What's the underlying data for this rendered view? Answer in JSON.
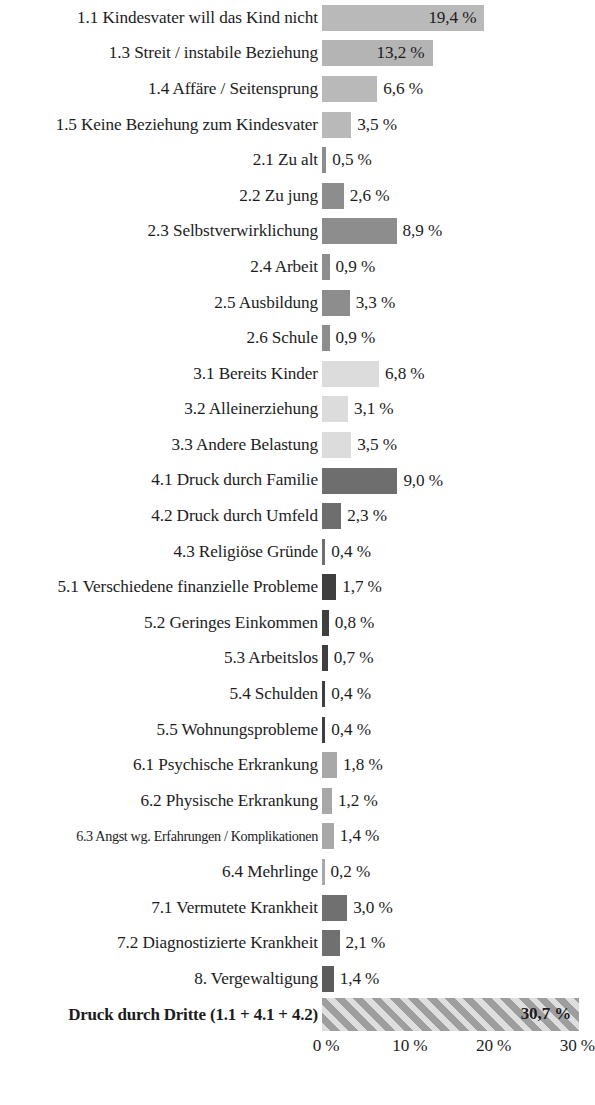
{
  "chart_data": {
    "type": "bar",
    "orientation": "horizontal",
    "title": "",
    "subtitle": "",
    "xlabel": "",
    "ylabel": "",
    "xlim": [
      0,
      32
    ],
    "grid": false,
    "legend": null,
    "value_suffix": " %",
    "decimal_separator": ",",
    "axis_ticks": [
      {
        "label": "0 %",
        "value": 0
      },
      {
        "label": "10 %",
        "value": 10
      },
      {
        "label": "20 %",
        "value": 20
      },
      {
        "label": "30 %",
        "value": 30
      }
    ],
    "categories": [
      "1.1 Kindesvater will das Kind nicht",
      "1.3 Streit / instabile Beziehung",
      "1.4 Affäre / Seitensprung",
      "1.5 Keine Beziehung zum Kindesvater",
      "2.1 Zu alt",
      "2.2 Zu jung",
      "2.3 Selbstverwirklichung",
      "2.4 Arbeit",
      "2.5 Ausbildung",
      "2.6 Schule",
      "3.1 Bereits Kinder",
      "3.2 Alleinerziehung",
      "3.3 Andere Belastung",
      "4.1 Druck durch Familie",
      "4.2 Druck durch Umfeld",
      "4.3 Religiöse Gründe",
      "5.1 Verschiedene finanzielle Probleme",
      "5.2 Geringes Einkommen",
      "5.3 Arbeitslos",
      "5.4 Schulden",
      "5.5 Wohnungsprobleme",
      "6.1 Psychische Erkrankung",
      "6.2 Physische Erkrankung",
      "6.3 Angst wg. Erfahrungen / Komplikationen",
      "6.4 Mehrlinge",
      "7.1 Vermutete Krankheit",
      "7.2 Diagnostizierte Krankheit",
      "8. Vergewaltigung",
      "Druck durch Dritte (1.1 + 4.1 + 4.2)"
    ],
    "values": [
      19.4,
      13.2,
      6.6,
      3.5,
      0.5,
      2.6,
      8.9,
      0.9,
      3.3,
      0.9,
      6.8,
      3.1,
      3.5,
      9.0,
      2.3,
      0.4,
      1.7,
      0.8,
      0.7,
      0.4,
      0.4,
      1.8,
      1.2,
      1.4,
      0.2,
      3.0,
      2.1,
      1.4,
      30.7
    ],
    "value_labels": [
      "19,4 %",
      "13,2 %",
      "6,6 %",
      "3,5 %",
      "0,5 %",
      "2,6 %",
      "8,9 %",
      "0,9 %",
      "3,3 %",
      "0,9 %",
      "6,8 %",
      "3,1 %",
      "3,5 %",
      "9,0 %",
      "2,3 %",
      "0,4 %",
      "1,7 %",
      "0,8 %",
      "0,7 %",
      "0,4 %",
      "0,4 %",
      "1,8 %",
      "1,2 %",
      "1,4 %",
      "0,2 %",
      "3,0 %",
      "2,1 %",
      "1,4 %",
      "30,7 %"
    ],
    "bar_colors": [
      "#b9b9b9",
      "#b4b4b4",
      "#b9b9b9",
      "#b9b9b9",
      "#8d8d8d",
      "#8d8d8d",
      "#8d8d8d",
      "#8d8d8d",
      "#8d8d8d",
      "#8d8d8d",
      "#dcdcdc",
      "#dcdcdc",
      "#dcdcdc",
      "#6e6e6e",
      "#6e6e6e",
      "#6e6e6e",
      "#3f3f3f",
      "#3f3f3f",
      "#3f3f3f",
      "#3f3f3f",
      "#3f3f3f",
      "#a8a8a8",
      "#a8a8a8",
      "#a8a8a8",
      "#a8a8a8",
      "#707070",
      "#707070",
      "#5c5c5c",
      "striped"
    ],
    "bars": [
      {
        "label": "1.1 Kindesvater will das Kind nicht",
        "value": 19.4,
        "value_label": "19,4 %",
        "color": "#b9b9b9",
        "label_inside": true
      },
      {
        "label": "1.3 Streit / instabile Beziehung",
        "value": 13.2,
        "value_label": "13,2 %",
        "color": "#b4b4b4",
        "label_inside": true
      },
      {
        "label": "1.4 Affäre / Seitensprung",
        "value": 6.6,
        "value_label": "6,6 %",
        "color": "#b9b9b9",
        "label_inside": false
      },
      {
        "label": "1.5 Keine Beziehung zum Kindesvater",
        "value": 3.5,
        "value_label": "3,5 %",
        "color": "#b9b9b9",
        "label_inside": false
      },
      {
        "label": "2.1 Zu alt",
        "value": 0.5,
        "value_label": "0,5 %",
        "color": "#8d8d8d",
        "label_inside": false
      },
      {
        "label": "2.2 Zu jung",
        "value": 2.6,
        "value_label": "2,6 %",
        "color": "#8d8d8d",
        "label_inside": false
      },
      {
        "label": "2.3 Selbstverwirklichung",
        "value": 8.9,
        "value_label": "8,9 %",
        "color": "#8d8d8d",
        "label_inside": false
      },
      {
        "label": "2.4 Arbeit",
        "value": 0.9,
        "value_label": "0,9 %",
        "color": "#8d8d8d",
        "label_inside": false
      },
      {
        "label": "2.5 Ausbildung",
        "value": 3.3,
        "value_label": "3,3 %",
        "color": "#8d8d8d",
        "label_inside": false
      },
      {
        "label": "2.6 Schule",
        "value": 0.9,
        "value_label": "0,9 %",
        "color": "#8d8d8d",
        "label_inside": false
      },
      {
        "label": "3.1 Bereits Kinder",
        "value": 6.8,
        "value_label": "6,8 %",
        "color": "#dcdcdc",
        "label_inside": false
      },
      {
        "label": "3.2 Alleinerziehung",
        "value": 3.1,
        "value_label": "3,1 %",
        "color": "#dcdcdc",
        "label_inside": false
      },
      {
        "label": "3.3 Andere Belastung",
        "value": 3.5,
        "value_label": "3,5 %",
        "color": "#dcdcdc",
        "label_inside": false
      },
      {
        "label": "4.1 Druck durch Familie",
        "value": 9.0,
        "value_label": "9,0 %",
        "color": "#6e6e6e",
        "label_inside": false
      },
      {
        "label": "4.2 Druck durch Umfeld",
        "value": 2.3,
        "value_label": "2,3 %",
        "color": "#6e6e6e",
        "label_inside": false
      },
      {
        "label": "4.3 Religiöse Gründe",
        "value": 0.4,
        "value_label": "0,4 %",
        "color": "#6e6e6e",
        "label_inside": false
      },
      {
        "label": "5.1 Verschiedene finanzielle Probleme",
        "value": 1.7,
        "value_label": "1,7 %",
        "color": "#3f3f3f",
        "label_inside": false
      },
      {
        "label": "5.2 Geringes Einkommen",
        "value": 0.8,
        "value_label": "0,8 %",
        "color": "#3f3f3f",
        "label_inside": false
      },
      {
        "label": "5.3 Arbeitslos",
        "value": 0.7,
        "value_label": "0,7 %",
        "color": "#3f3f3f",
        "label_inside": false
      },
      {
        "label": "5.4 Schulden",
        "value": 0.4,
        "value_label": "0,4 %",
        "color": "#3f3f3f",
        "label_inside": false
      },
      {
        "label": "5.5 Wohnungsprobleme",
        "value": 0.4,
        "value_label": "0,4 %",
        "color": "#3f3f3f",
        "label_inside": false
      },
      {
        "label": "6.1 Psychische Erkrankung",
        "value": 1.8,
        "value_label": "1,8 %",
        "color": "#a8a8a8",
        "label_inside": false
      },
      {
        "label": "6.2 Physische Erkrankung",
        "value": 1.2,
        "value_label": "1,2 %",
        "color": "#a8a8a8",
        "label_inside": false
      },
      {
        "label": "6.3 Angst wg. Erfahrungen / Komplikationen",
        "value": 1.4,
        "value_label": "1,4 %",
        "color": "#a8a8a8",
        "label_inside": false
      },
      {
        "label": "6.4 Mehrlinge",
        "value": 0.2,
        "value_label": "0,2 %",
        "color": "#a8a8a8",
        "label_inside": false
      },
      {
        "label": "7.1 Vermutete Krankheit",
        "value": 3.0,
        "value_label": "3,0 %",
        "color": "#707070",
        "label_inside": false
      },
      {
        "label": "7.2 Diagnostizierte Krankheit",
        "value": 2.1,
        "value_label": "2,1 %",
        "color": "#707070",
        "label_inside": false
      },
      {
        "label": "8. Vergewaltigung",
        "value": 1.4,
        "value_label": "1,4 %",
        "color": "#5c5c5c",
        "label_inside": false
      },
      {
        "label": "Druck durch Dritte (1.1 + 4.1 + 4.2)",
        "value": 30.7,
        "value_label": "30,7 %",
        "color": "striped",
        "label_inside": true
      }
    ]
  }
}
